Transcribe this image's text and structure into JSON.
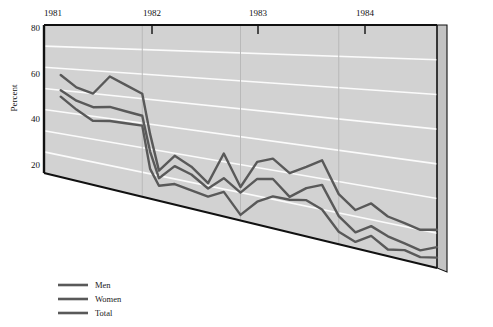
{
  "chart_data": {
    "type": "line",
    "title": "",
    "xlabel": "",
    "ylabel": "Percent",
    "ylim": [
      10,
      80
    ],
    "yticks": [
      20,
      40,
      60,
      80
    ],
    "ytick_labels": [
      "20",
      "40",
      "60",
      "80"
    ],
    "gridlines_y": [
      20,
      30,
      40,
      50,
      60,
      70,
      80
    ],
    "grid": true,
    "xlim": [
      1981.0,
      1985.0
    ],
    "xticks": [
      1981,
      1982,
      1983,
      1984
    ],
    "xtick_labels": [
      "1981",
      "1982",
      "1983",
      "1984"
    ],
    "legend_position": "bottom-left",
    "x": [
      1981.17,
      1981.33,
      1981.5,
      1981.67,
      1981.83,
      1982.0,
      1982.08,
      1982.17,
      1982.33,
      1982.5,
      1982.67,
      1982.83,
      1983.0,
      1983.17,
      1983.33,
      1983.5,
      1983.67,
      1983.83,
      1984.0,
      1984.17,
      1984.33,
      1984.5,
      1984.67,
      1984.83,
      1985.0
    ],
    "series": [
      {
        "name": "Men",
        "color": "#595959",
        "values": [
          57,
          52,
          50,
          58,
          55,
          52,
          36,
          22,
          29,
          26,
          21,
          33,
          22,
          32,
          34,
          30,
          33,
          36,
          26,
          22,
          25,
          22,
          21,
          20,
          21
        ]
      },
      {
        "name": "Women",
        "color": "#595959",
        "values": [
          50,
          46,
          44,
          45,
          44,
          43,
          29,
          19,
          25,
          23,
          19,
          24,
          20,
          26,
          27,
          22,
          26,
          28,
          19,
          15,
          18,
          16,
          15,
          14,
          16
        ]
      },
      {
        "name": "Total",
        "color": "#595959",
        "values": [
          47,
          42,
          38,
          39,
          39,
          39,
          22,
          16,
          18,
          17,
          16,
          19,
          12,
          18,
          21,
          21,
          22,
          20,
          14,
          12,
          15,
          12,
          13,
          12,
          13
        ]
      }
    ]
  },
  "axes": {
    "y_axis_title": "Percent",
    "y_tick_20": "20",
    "y_tick_40": "40",
    "y_tick_60": "60",
    "y_tick_80": "80",
    "x_tick_1981": "1981",
    "x_tick_1982": "1982",
    "x_tick_1983": "1983",
    "x_tick_1984": "1984"
  },
  "legend": {
    "items": [
      {
        "label": "Men",
        "color": "#595959"
      },
      {
        "label": "Women",
        "color": "#595959"
      },
      {
        "label": "Total",
        "color": "#595959"
      }
    ]
  },
  "colors": {
    "plot_fill": "#d2d2d2",
    "side_panel": "#c3c3c3",
    "gridline": "#fbfbfb",
    "frame": "#111111",
    "series": "#595959",
    "page_background": "#ffffff"
  }
}
